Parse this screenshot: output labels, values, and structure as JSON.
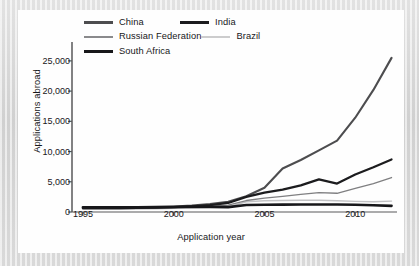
{
  "chart_data": {
    "type": "line",
    "title": "",
    "xlabel": "Application year",
    "ylabel": "Applications abroad",
    "xlim": [
      1994.4,
      2012.3
    ],
    "ylim": [
      0,
      26800
    ],
    "grid": false,
    "legend_position": "top",
    "x_ticks": [
      "1995",
      "2000",
      "2005",
      "2010"
    ],
    "x_tick_values": [
      1995,
      2000,
      2005,
      2010
    ],
    "y_ticks": [
      "0",
      "5,000",
      "10,000",
      "15,000",
      "20,000",
      "25,000"
    ],
    "y_tick_values": [
      0,
      5000,
      10000,
      15000,
      20000,
      25000
    ],
    "x": [
      1995,
      1996,
      1997,
      1998,
      1999,
      2000,
      2001,
      2002,
      2003,
      2004,
      2005,
      2006,
      2007,
      2008,
      2009,
      2010,
      2011,
      2012
    ],
    "series": [
      {
        "name": "China",
        "color": "#4d4d4f",
        "width": 2.1,
        "values": [
          700,
          700,
          720,
          760,
          800,
          900,
          1050,
          1300,
          1700,
          2600,
          4000,
          7200,
          8600,
          10200,
          11800,
          15600,
          20200,
          25500
        ]
      },
      {
        "name": "India",
        "color": "#1c1c1e",
        "width": 2.2,
        "values": [
          620,
          620,
          640,
          660,
          700,
          800,
          950,
          1150,
          1500,
          2500,
          3200,
          3700,
          4400,
          5400,
          4700,
          6200,
          7400,
          8700
        ]
      },
      {
        "name": "Russian Federation",
        "color": "#7f7f81",
        "width": 1.3,
        "values": [
          560,
          560,
          580,
          600,
          640,
          700,
          820,
          950,
          1150,
          1900,
          2300,
          2600,
          2900,
          3200,
          3100,
          3900,
          4700,
          5700
        ]
      },
      {
        "name": "Brazil",
        "color": "#c2c2c4",
        "width": 1.4,
        "values": [
          430,
          440,
          460,
          490,
          540,
          620,
          700,
          760,
          820,
          1700,
          1850,
          1900,
          1950,
          1950,
          1850,
          1750,
          1700,
          1800
        ]
      },
      {
        "name": "South Africa",
        "color": "#17171a",
        "width": 2.6,
        "values": [
          780,
          760,
          760,
          780,
          800,
          830,
          840,
          820,
          800,
          1150,
          1200,
          1220,
          1230,
          1240,
          1230,
          1200,
          1120,
          1020
        ]
      }
    ]
  },
  "legend": {
    "items": [
      {
        "label": "China",
        "color": "#4d4d4f",
        "thickness": "2.6px",
        "key": "c-china"
      },
      {
        "label": "India",
        "color": "#1c1c1e",
        "thickness": "2.8px",
        "key": "c-india"
      },
      {
        "label": "Russian Federation",
        "color": "#8a8a8c",
        "thickness": "1.5px",
        "key": "c-russia"
      },
      {
        "label": "Brazil",
        "color": "#cccccd",
        "thickness": "1.7px",
        "key": "c-brazil"
      },
      {
        "label": "South Africa",
        "color": "#17171a",
        "thickness": "3.2px",
        "key": "c-southafrica"
      }
    ]
  },
  "axes": {
    "x_title": "Application year",
    "y_title": "Applications abroad"
  }
}
